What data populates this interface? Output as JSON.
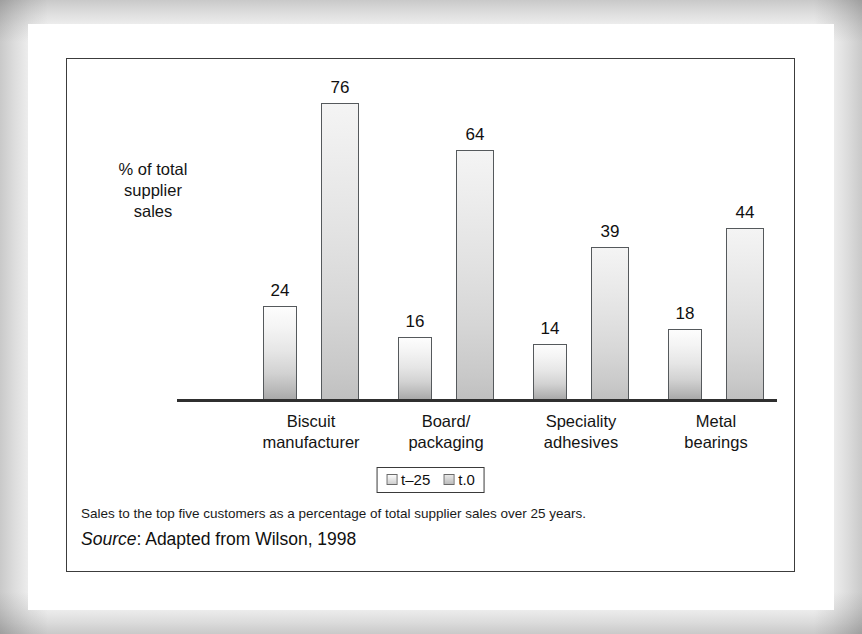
{
  "figure": {
    "y_axis_label": "% of total\nsupplier\nsales",
    "caption": "Sales to the top five customers as a percentage of total supplier sales over 25 years.",
    "source_word": "Source",
    "source_rest": ": Adapted from Wilson, 1998"
  },
  "legend": {
    "entries": [
      {
        "label": "t–25",
        "swatch": "series-0-swatch"
      },
      {
        "label": "t.0",
        "swatch": "series-1-swatch"
      }
    ]
  },
  "chart_data": {
    "type": "bar",
    "title": "",
    "xlabel": "",
    "ylabel": "% of total supplier sales",
    "ylim": [
      0,
      80
    ],
    "grid": false,
    "legend_position": "bottom-center",
    "categories": [
      "Biscuit\nmanufacturer",
      "Board/\npackaging",
      "Speciality\nadhesives",
      "Metal\nbearings"
    ],
    "series": [
      {
        "name": "t–25",
        "values": [
          24,
          16,
          14,
          18
        ]
      },
      {
        "name": "t.0",
        "values": [
          76,
          64,
          39,
          44
        ]
      }
    ],
    "annotations": [
      "Sales to the top five customers as a percentage of total supplier sales over 25 years.",
      "Source: Adapted from Wilson, 1998"
    ]
  },
  "colors": {
    "bar_series_0_top": "#fdfdfd",
    "bar_series_0_bottom": "#a9a9a9",
    "bar_series_1_top": "#f4f4f4",
    "bar_series_1_bottom": "#c0c0c0",
    "axis": "#2f2f2f",
    "text": "#101010",
    "frame": "#3c3c3c"
  }
}
